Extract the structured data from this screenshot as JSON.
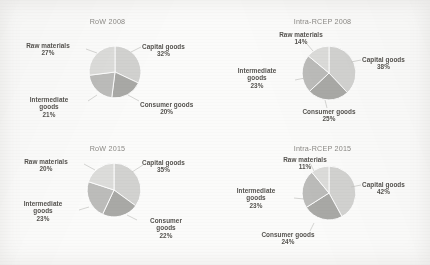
{
  "figure": {
    "background_color": "#fbfbfa",
    "text_color": "#55534f",
    "title_color": "#8c8a86"
  },
  "palette": {
    "capital_goods": "#d2d2d0",
    "consumer_goods": "#a9a9a6",
    "intermediate_goods": "#bcbcba",
    "raw_materials": "#dcdcda",
    "separator": "#ffffff",
    "leader_line": "#c4c4c1"
  },
  "chart_data": [
    {
      "type": "pie",
      "title": "RoW 2008",
      "labels": [
        "Capital goods",
        "Consumer goods",
        "Intermediate goods",
        "Raw materials"
      ],
      "values": [
        32,
        20,
        21,
        27
      ],
      "value_labels": [
        "32%",
        "20%",
        "21%",
        "27%"
      ],
      "start_angle": 0,
      "direction": "clockwise",
      "legend": "none"
    },
    {
      "type": "pie",
      "title": "Intra-RCEP 2008",
      "labels": [
        "Capital goods",
        "Consumer goods",
        "Intermediate goods",
        "Raw materials"
      ],
      "values": [
        38,
        25,
        23,
        14
      ],
      "value_labels": [
        "38%",
        "25%",
        "23%",
        "14%"
      ],
      "start_angle": 0,
      "direction": "clockwise",
      "legend": "none"
    },
    {
      "type": "pie",
      "title": "RoW 2015",
      "labels": [
        "Capital goods",
        "Consumer goods",
        "Intermediate goods",
        "Raw materials"
      ],
      "values": [
        35,
        22,
        23,
        20
      ],
      "value_labels": [
        "35%",
        "22%",
        "23%",
        "20%"
      ],
      "start_angle": 0,
      "direction": "clockwise",
      "legend": "none"
    },
    {
      "type": "pie",
      "title": "Intra-RCEP 2015",
      "labels": [
        "Capital goods",
        "Consumer goods",
        "Intermediate goods",
        "Raw materials"
      ],
      "values": [
        42,
        24,
        23,
        11
      ],
      "value_labels": [
        "42%",
        "24%",
        "23%",
        "11%"
      ],
      "start_angle": 0,
      "direction": "clockwise",
      "legend": "none"
    }
  ],
  "panels": {
    "row2008": {
      "title": "RoW 2008",
      "capital_name": "Capital goods",
      "capital_pct": "32%",
      "consumer_name": "Consumer goods",
      "consumer_pct": "20%",
      "intermediate_name": "Intermediate",
      "intermediate_name2": "goods",
      "intermediate_pct": "21%",
      "raw_name": "Raw materials",
      "raw_pct": "27%"
    },
    "rcep2008": {
      "title": "Intra-RCEP 2008",
      "capital_name": "Capital goods",
      "capital_pct": "38%",
      "consumer_name": "Consumer goods",
      "consumer_pct": "25%",
      "intermediate_name": "Intermediate",
      "intermediate_name2": "goods",
      "intermediate_pct": "23%",
      "raw_name": "Raw materials",
      "raw_pct": "14%"
    },
    "row2015": {
      "title": "RoW 2015",
      "capital_name": "Capital goods",
      "capital_pct": "35%",
      "consumer_name": "Consumer",
      "consumer_name2": "goods",
      "consumer_pct": "22%",
      "intermediate_name": "Intermediate",
      "intermediate_name2": "goods",
      "intermediate_pct": "23%",
      "raw_name": "Raw materials",
      "raw_pct": "20%"
    },
    "rcep2015": {
      "title": "Intra-RCEP 2015",
      "capital_name": "Capital goods",
      "capital_pct": "42%",
      "consumer_name": "Consumer goods",
      "consumer_pct": "24%",
      "intermediate_name": "Intermediate",
      "intermediate_name2": "goods",
      "intermediate_pct": "23%",
      "raw_name": "Raw materials",
      "raw_pct": "11%"
    }
  }
}
